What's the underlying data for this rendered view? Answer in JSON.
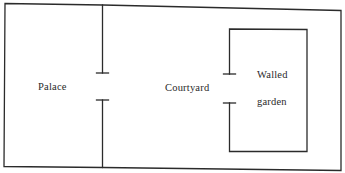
{
  "diagram": {
    "colors": {
      "stroke": "#2b2b2b",
      "text": "#2a2a2a",
      "background": "#ffffff"
    },
    "regions": [
      {
        "id": "palace",
        "label": "Palace"
      },
      {
        "id": "courtyard",
        "label": "Courtyard"
      },
      {
        "id": "walled-garden",
        "label_line1": "Walled",
        "label_line2": "garden"
      }
    ],
    "labels": {
      "palace": "Palace",
      "courtyard": "Courtyard",
      "walled": "Walled",
      "garden": "garden"
    },
    "openings": [
      {
        "between": [
          "Palace",
          "Courtyard"
        ]
      },
      {
        "between": [
          "Courtyard",
          "Walled garden"
        ]
      }
    ]
  }
}
